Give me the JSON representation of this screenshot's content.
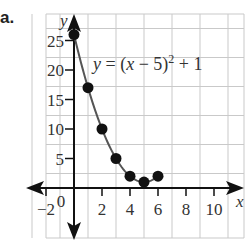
{
  "figure_label": "a.",
  "chart_data": {
    "type": "line",
    "title": "",
    "equation_label": "y = (x − 5)",
    "equation_exponent": "2",
    "equation_tail": " + 1",
    "equation": "y = (x - 5)^2 + 1",
    "xlabel": "x",
    "ylabel": "y",
    "x": [
      0,
      1,
      2,
      3,
      4,
      5,
      6
    ],
    "values": [
      26,
      17,
      10,
      5,
      2,
      1,
      2
    ],
    "series": [
      {
        "name": "y = (x - 5)^2 + 1",
        "x": [
          0,
          1,
          2,
          3,
          4,
          5,
          6
        ],
        "values": [
          26,
          17,
          10,
          5,
          2,
          1,
          2
        ],
        "markers": true,
        "color": "#111111",
        "line_color": "#555555"
      }
    ],
    "xlim": [
      -3,
      11
    ],
    "ylim": [
      -5,
      30
    ],
    "x_ticks": [
      -2,
      0,
      2,
      4,
      6,
      8,
      10
    ],
    "x_tick_labels": [
      "−2",
      "0",
      "2",
      "4",
      "6",
      "8",
      "10"
    ],
    "y_ticks": [
      5,
      10,
      15,
      20,
      25
    ],
    "y_tick_labels": [
      "5",
      "10",
      "15",
      "20",
      "25"
    ],
    "grid": true,
    "grid_color": "#c9c9c9",
    "axis_color": "#111111",
    "legend": null
  }
}
